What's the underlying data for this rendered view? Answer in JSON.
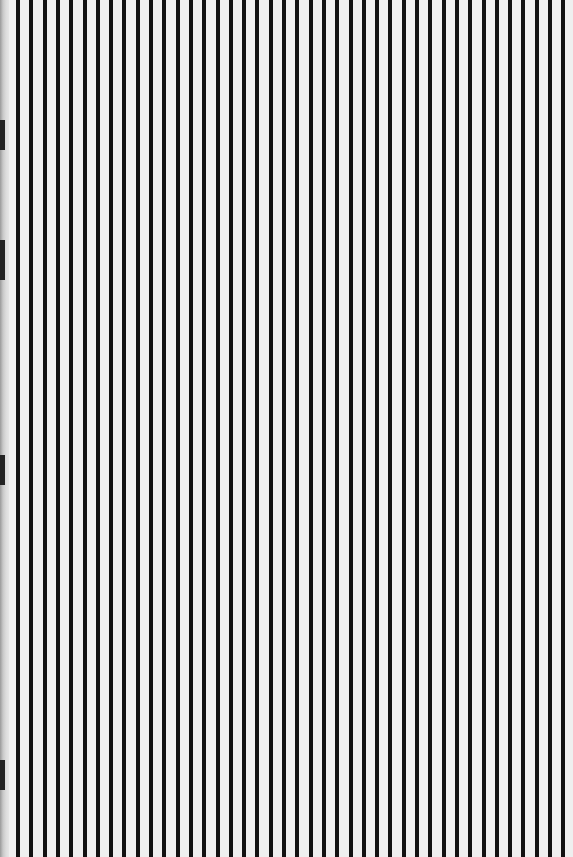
{
  "image": {
    "description": "Scanned page of evenly spaced vertical black lines on off-white paper",
    "width": 573,
    "height": 857
  },
  "pattern": {
    "line_count": 42,
    "first_line_x": 16,
    "spacing_px": 13.3,
    "line_width_px": 4,
    "line_color": "#111111",
    "background_color": "#efefef"
  },
  "edge_marks": [
    {
      "top": 120,
      "height": 30
    },
    {
      "top": 240,
      "height": 40
    },
    {
      "top": 455,
      "height": 30
    },
    {
      "top": 760,
      "height": 30
    }
  ],
  "caption": ""
}
